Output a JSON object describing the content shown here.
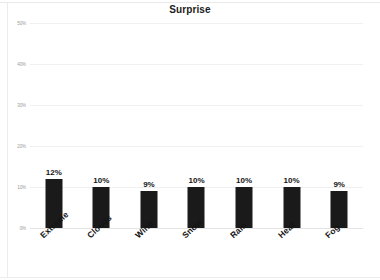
{
  "chart_data": {
    "type": "bar",
    "title": "Surprise",
    "xlabel": "",
    "ylabel": "",
    "categories": [
      "Extreme",
      "Clouds",
      "Wind",
      "Snow",
      "Rain",
      "Heat",
      "Fog"
    ],
    "values": [
      12,
      10,
      9,
      10,
      10,
      10,
      9
    ],
    "data_labels": [
      "12%",
      "10%",
      "9%",
      "10%",
      "10%",
      "10%",
      "9%"
    ],
    "ylim": [
      0,
      50
    ],
    "yticks": [
      0,
      10,
      20,
      30,
      40,
      50
    ],
    "ytick_labels": [
      "0%",
      "10%",
      "20%",
      "30%",
      "40%",
      "50%"
    ],
    "grid": true,
    "legend": false,
    "legend_position": "none",
    "series": [
      {
        "name": "Surprise",
        "values": [
          12,
          10,
          9,
          10,
          10,
          10,
          9
        ]
      }
    ],
    "colors": {
      "bar": "#1a1a1a",
      "gridline": "#f0f0f0",
      "title_text": "#1b1b1b",
      "tick_text": "#9a9a9a",
      "label_text": "#141414",
      "background": "#ffffff"
    }
  }
}
